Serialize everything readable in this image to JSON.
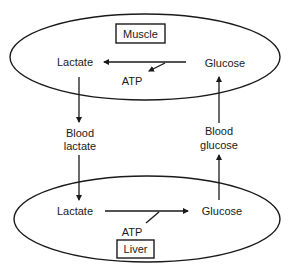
{
  "diagram": {
    "type": "cori-cycle",
    "colors": {
      "stroke": "#1a1a1a",
      "background": "#ffffff",
      "text": "#1a1a1a"
    },
    "muscle": {
      "label": "Muscle",
      "lactate": "Lactate",
      "glucose": "Glucose",
      "atp": "ATP"
    },
    "blood": {
      "left_line1": "Blood",
      "left_line2": "lactate",
      "right_line1": "Blood",
      "right_line2": "glucose"
    },
    "liver": {
      "label": "Liver",
      "lactate": "Lactate",
      "glucose": "Glucose",
      "atp": "ATP"
    }
  }
}
